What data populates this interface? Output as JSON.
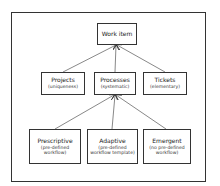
{
  "diagram": {
    "root": {
      "label": "Work item"
    },
    "level2": [
      {
        "label": "Projects",
        "sub": "(uniqueness)"
      },
      {
        "label": "Processes",
        "sub": "(systematic)"
      },
      {
        "label": "Tickets",
        "sub": "(elementary)"
      }
    ],
    "level3": [
      {
        "label": "Prescriptive",
        "sub1": "(pre-defined",
        "sub2": "workflow)"
      },
      {
        "label": "Adaptive",
        "sub1": "(pre-defined",
        "sub2": "workflow template)"
      },
      {
        "label": "Emergent",
        "sub1": "(no pre-defined",
        "sub2": "workflow)"
      }
    ],
    "edges": [
      {
        "from": "Projects",
        "to": "Work item"
      },
      {
        "from": "Processes",
        "to": "Work item"
      },
      {
        "from": "Tickets",
        "to": "Work item"
      },
      {
        "from": "Prescriptive",
        "to": "Processes"
      },
      {
        "from": "Adaptive",
        "to": "Processes"
      },
      {
        "from": "Emergent",
        "to": "Processes"
      }
    ]
  }
}
